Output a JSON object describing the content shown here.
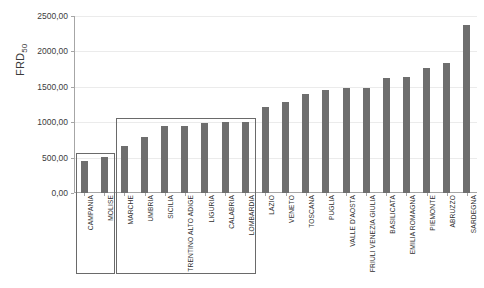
{
  "chart_data": {
    "type": "bar",
    "title": "",
    "xlabel": "",
    "ylabel": "FRD50",
    "ylabel_display": {
      "base": "FRD",
      "subscript": "50"
    },
    "ylim": [
      0,
      2500
    ],
    "ytick_labels": [
      "0,00",
      "500,00",
      "1000,00",
      "1500,00",
      "2000,00",
      "2500,00"
    ],
    "ytick_values": [
      0,
      500,
      1000,
      1500,
      2000,
      2500
    ],
    "grid": true,
    "legend": "none",
    "bar_color": "#6e6e6e",
    "grid_color": "#ebebeb",
    "axis_color": "#a6a6a6",
    "categories": [
      "CAMPANIA",
      "MOLISE",
      "MARCHE",
      "UMBRIA",
      "SICILIA",
      "TRENTINO ALTO ADIGE",
      "LIGURIA",
      "CALABRIA",
      "LOMBARDIA",
      "LAZIO",
      "VENETO",
      "TOSCANA",
      "PUGLIA",
      "VALLE D'AOSTA",
      "FRIULI VENEZIA GIULIA",
      "BASILICATA",
      "EMILIA ROMAGNA",
      "PIEMONTE",
      "ABRUZZO",
      "SARDEGNA"
    ],
    "values": [
      450,
      510,
      670,
      790,
      940,
      950,
      990,
      1000,
      1010,
      1215,
      1290,
      1400,
      1450,
      1490,
      1490,
      1620,
      1640,
      1760,
      1830,
      2380
    ],
    "annotations": [
      {
        "name": "group-box-lowest",
        "categories": [
          "CAMPANIA",
          "MOLISE"
        ],
        "start_index": 0,
        "end_index": 1,
        "top_value": 560
      },
      {
        "name": "group-box-low",
        "categories": [
          "MARCHE",
          "UMBRIA",
          "SICILIA",
          "TRENTINO ALTO ADIGE",
          "LIGURIA",
          "CALABRIA",
          "LOMBARDIA"
        ],
        "start_index": 2,
        "end_index": 8,
        "top_value": 1060
      }
    ]
  }
}
